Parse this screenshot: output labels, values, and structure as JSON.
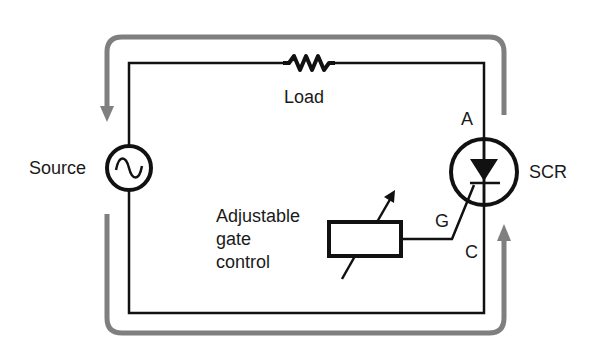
{
  "diagram": {
    "labels": {
      "load": "Load",
      "source": "Source",
      "scr": "SCR",
      "anode": "A",
      "cathode": "C",
      "gate": "G",
      "gate_control_line1": "Adjustable",
      "gate_control_line2": "gate",
      "gate_control_line3": "control"
    },
    "components": [
      {
        "id": "load",
        "type": "resistor",
        "label": "Load"
      },
      {
        "id": "source",
        "type": "ac-source",
        "label": "Source"
      },
      {
        "id": "scr",
        "type": "thyristor",
        "label": "SCR",
        "terminals": [
          "A",
          "G",
          "C"
        ]
      },
      {
        "id": "gate-control",
        "type": "variable-resistor-box",
        "label": "Adjustable gate control"
      }
    ],
    "current_flow": {
      "direction": "counter-clockwise outer loop",
      "color": "#808080"
    },
    "colors": {
      "wire": "#111111",
      "flow_arrow": "#7f7f7f",
      "background": "#ffffff"
    }
  }
}
